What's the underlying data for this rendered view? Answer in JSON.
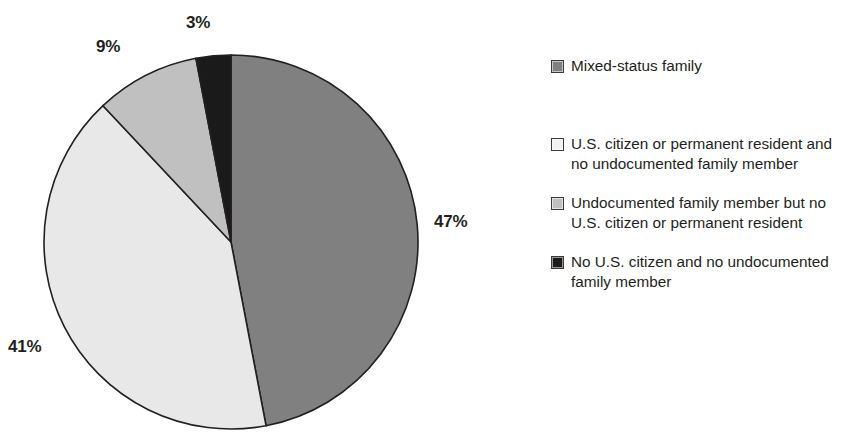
{
  "chart_data": {
    "type": "pie",
    "title": "",
    "subtitle": "",
    "xlabel": "",
    "ylabel": "",
    "grid": false,
    "legend_position": "right",
    "start_angle_deg": 0,
    "direction": "clockwise",
    "categories": [
      "Mixed-status family",
      "U.S. citizen or permanent resident and no undocumented family member",
      "Undocumented family member but no U.S. citizen or permanent resident",
      "No U.S. citizen and no undocumented family member"
    ],
    "values": [
      47,
      41,
      9,
      3
    ],
    "data_labels": [
      "47%",
      "41%",
      "9%",
      "3%"
    ],
    "colors": [
      "#808080",
      "#e8e8e8",
      "#c0c0c0",
      "#1a1a1a"
    ],
    "slice_outline_color": "#231f20",
    "units": "percent"
  },
  "legend": {
    "items": [
      {
        "label": "Mixed-status family",
        "color": "#808080"
      },
      {
        "label": "U.S. citizen or permanent resident and no undocumented family member",
        "color": "#f2f2f2"
      },
      {
        "label": "Undocumented family member but no U.S. citizen or permanent resident",
        "color": "#c0c0c0"
      },
      {
        "label": "No U.S. citizen and no undocumented family member",
        "color": "#1a1a1a"
      }
    ]
  },
  "pie_labels": {
    "slice_0": "47%",
    "slice_1": "41%",
    "slice_2": "9%",
    "slice_3": "3%"
  }
}
